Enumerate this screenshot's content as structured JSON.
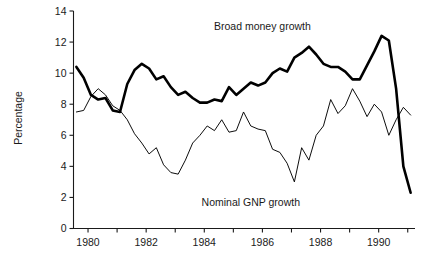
{
  "chart_data": {
    "type": "line",
    "title": "",
    "xlabel": "",
    "ylabel": "Percentage",
    "xlim": [
      1979.5,
      1991.25
    ],
    "ylim": [
      0,
      14
    ],
    "grid": false,
    "legend_position": "inline-annotations",
    "yticks": [
      0,
      2,
      4,
      6,
      8,
      10,
      12,
      14
    ],
    "ytick_labels": [
      "0",
      "2",
      "4",
      "6",
      "8",
      "10",
      "12",
      "14"
    ],
    "xticks": [
      1980,
      1981,
      1982,
      1983,
      1984,
      1985,
      1986,
      1987,
      1988,
      1989,
      1990,
      1991
    ],
    "xtick_labels": [
      "1980",
      "",
      "1982",
      "",
      "1984",
      "",
      "1986",
      "",
      "1988",
      "",
      "1990",
      ""
    ],
    "xtick_labeled": [
      1980,
      1982,
      1984,
      1986,
      1988,
      1990
    ],
    "annotations": [
      {
        "text": "Broad money growth",
        "x": 1986.0,
        "y": 13.0
      },
      {
        "text": "Nominal GNP growth",
        "x": 1985.6,
        "y": 1.7
      }
    ],
    "series": [
      {
        "name": "Broad money growth",
        "style": "bold",
        "color": "#000000",
        "x": [
          1979.6,
          1979.85,
          1980.1,
          1980.35,
          1980.6,
          1980.85,
          1981.1,
          1981.35,
          1981.6,
          1981.85,
          1982.1,
          1982.35,
          1982.6,
          1982.85,
          1983.1,
          1983.35,
          1983.6,
          1983.85,
          1984.1,
          1984.35,
          1984.6,
          1984.85,
          1985.1,
          1985.35,
          1985.6,
          1985.85,
          1986.1,
          1986.35,
          1986.6,
          1986.85,
          1987.1,
          1987.35,
          1987.6,
          1987.85,
          1988.1,
          1988.35,
          1988.6,
          1988.85,
          1989.1,
          1989.35,
          1989.6,
          1989.85,
          1990.1,
          1990.35,
          1990.6,
          1990.85,
          1991.1
        ],
        "y": [
          10.4,
          9.7,
          8.6,
          8.3,
          8.4,
          7.6,
          7.5,
          9.3,
          10.2,
          10.6,
          10.3,
          9.6,
          9.8,
          9.1,
          8.6,
          8.8,
          8.4,
          8.1,
          8.1,
          8.3,
          8.2,
          9.1,
          8.6,
          9.0,
          9.4,
          9.2,
          9.4,
          10.0,
          10.3,
          10.1,
          11.0,
          11.3,
          11.7,
          11.2,
          10.6,
          10.4,
          10.4,
          10.1,
          9.6,
          9.6,
          10.5,
          11.4,
          12.4,
          12.1,
          9.0,
          4.0,
          2.3
        ]
      },
      {
        "name": "Nominal GNP growth",
        "style": "thin",
        "color": "#000000",
        "x": [
          1979.6,
          1979.85,
          1980.1,
          1980.35,
          1980.6,
          1980.85,
          1981.1,
          1981.35,
          1981.6,
          1981.85,
          1982.1,
          1982.35,
          1982.6,
          1982.85,
          1983.1,
          1983.35,
          1983.6,
          1983.85,
          1984.1,
          1984.35,
          1984.6,
          1984.85,
          1985.1,
          1985.35,
          1985.6,
          1985.85,
          1986.1,
          1986.35,
          1986.6,
          1986.85,
          1987.1,
          1987.35,
          1987.6,
          1987.85,
          1988.1,
          1988.35,
          1988.6,
          1988.85,
          1989.1,
          1989.35,
          1989.6,
          1989.85,
          1990.1,
          1990.35,
          1990.6,
          1990.85,
          1991.1
        ],
        "y": [
          7.5,
          7.6,
          8.5,
          9.0,
          8.6,
          7.9,
          7.6,
          7.0,
          6.1,
          5.5,
          4.8,
          5.2,
          4.1,
          3.6,
          3.5,
          4.4,
          5.5,
          6.0,
          6.6,
          6.3,
          7.0,
          6.2,
          6.3,
          7.5,
          6.6,
          6.4,
          6.3,
          5.1,
          4.9,
          4.2,
          3.0,
          5.2,
          4.4,
          6.0,
          6.6,
          8.3,
          7.4,
          7.9,
          9.0,
          8.2,
          7.2,
          8.0,
          7.5,
          6.0,
          7.0,
          7.8,
          7.3
        ]
      }
    ]
  }
}
